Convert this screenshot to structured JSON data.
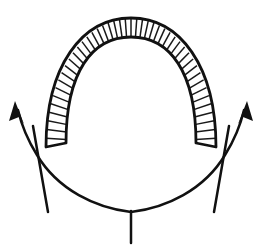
{
  "figure": {
    "background_color": "#ffffff",
    "ink_color": "#111111",
    "width": 262,
    "height": 251
  },
  "chart_data": {
    "type": "diagram",
    "title": "",
    "xlabel": "",
    "ylabel": "",
    "elements": [
      {
        "name": "hatched-arch-band",
        "description": "Inverted-U shaped band filled with radial hatch lines",
        "outer_apex": [
          131,
          18
        ],
        "inner_apex": [
          131,
          37
        ],
        "left_outer_foot": [
          46,
          147
        ],
        "left_inner_foot": [
          66,
          143
        ],
        "right_outer_foot": [
          216,
          147
        ],
        "right_inner_foot": [
          196,
          143
        ],
        "hatch_count": 46,
        "hatch_color": "#1a1a1a",
        "outline_color": "#111111",
        "outline_width": 2.6
      },
      {
        "name": "u-curve-left-branch",
        "description": "Smile curve rising to upper-left arrowhead",
        "points": [
          [
            131,
            212
          ],
          [
            78,
            196
          ],
          [
            38,
            160
          ],
          [
            18,
            110
          ]
        ],
        "arrow_tip": [
          16,
          104
        ],
        "stroke_width": 2.4
      },
      {
        "name": "u-curve-right-branch",
        "description": "Smile curve rising to upper-right arrowhead",
        "points": [
          [
            131,
            212
          ],
          [
            184,
            196
          ],
          [
            224,
            160
          ],
          [
            244,
            110
          ]
        ],
        "arrow_tip": [
          246,
          104
        ],
        "stroke_width": 2.4
      },
      {
        "name": "straight-line-left",
        "description": "Near vertical straight line crossing the left branch",
        "start": [
          33,
          126
        ],
        "end": [
          48,
          212
        ],
        "stroke_width": 2.4
      },
      {
        "name": "straight-line-right",
        "description": "Near vertical straight line crossing the right branch",
        "start": [
          229,
          126
        ],
        "end": [
          214,
          212
        ],
        "stroke_width": 2.4
      },
      {
        "name": "bottom-tick",
        "description": "Short vertical tick below the curve vertex",
        "start": [
          131,
          211
        ],
        "end": [
          131,
          243
        ],
        "stroke_width": 2.4
      }
    ],
    "annotations": [],
    "legend": [],
    "grid": false
  }
}
